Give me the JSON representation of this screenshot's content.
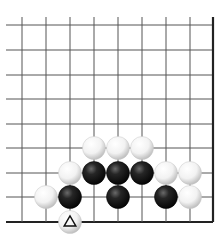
{
  "board": {
    "grid": {
      "x_lines": [
        22,
        46,
        70,
        94,
        118,
        142,
        166,
        190,
        213
      ],
      "y_lines": [
        25,
        50,
        75,
        99,
        124,
        148,
        173,
        197,
        222
      ],
      "left_open_extend": 16,
      "top_open_extend": 8,
      "right_edge": true,
      "bottom_edge": true,
      "line_color": "#555555",
      "edge_color": "#222222"
    },
    "stone_radius": 11.5,
    "stones": [
      {
        "color": "white",
        "col": 3,
        "row": 5
      },
      {
        "color": "white",
        "col": 4,
        "row": 5
      },
      {
        "color": "white",
        "col": 5,
        "row": 5
      },
      {
        "color": "white",
        "col": 2,
        "row": 6
      },
      {
        "color": "black",
        "col": 3,
        "row": 6
      },
      {
        "color": "black",
        "col": 4,
        "row": 6
      },
      {
        "color": "black",
        "col": 5,
        "row": 6
      },
      {
        "color": "white",
        "col": 6,
        "row": 6
      },
      {
        "color": "white",
        "col": 7,
        "row": 6
      },
      {
        "color": "white",
        "col": 1,
        "row": 7
      },
      {
        "color": "black",
        "col": 2,
        "row": 7
      },
      {
        "color": "black",
        "col": 4,
        "row": 7
      },
      {
        "color": "black",
        "col": 6,
        "row": 7
      },
      {
        "color": "white",
        "col": 7,
        "row": 7
      },
      {
        "color": "white",
        "col": 2,
        "row": 8,
        "marker": "triangle"
      }
    ]
  }
}
